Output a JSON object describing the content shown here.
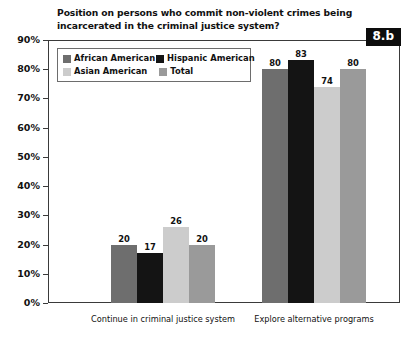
{
  "badge": {
    "label": "8.b"
  },
  "chart_data": {
    "type": "bar",
    "title": "Position on persons who commit non-violent crimes being\nincarcerated in the criminal justice system?",
    "xlabel": "",
    "ylabel": "",
    "ylim": [
      0,
      90
    ],
    "grid": false,
    "legend_position": "upper-left-inside",
    "ytick_labels": [
      "90%",
      "80%",
      "70%",
      "60%",
      "50%",
      "40%",
      "30%",
      "20%",
      "10%",
      "0%"
    ],
    "ytick_values": [
      90,
      80,
      70,
      60,
      50,
      40,
      30,
      20,
      10,
      0
    ],
    "categories": [
      "Continue in criminal justice system",
      "Explore alternative programs"
    ],
    "series": [
      {
        "name": "African American",
        "color": "#6e6e6e",
        "values": [
          20,
          80
        ]
      },
      {
        "name": "Hispanic American",
        "color": "#141414",
        "values": [
          17,
          83
        ]
      },
      {
        "name": "Asian American",
        "color": "#cccccc",
        "values": [
          26,
          74
        ]
      },
      {
        "name": "Total",
        "color": "#9a9a9a",
        "values": [
          20,
          80
        ]
      }
    ]
  }
}
